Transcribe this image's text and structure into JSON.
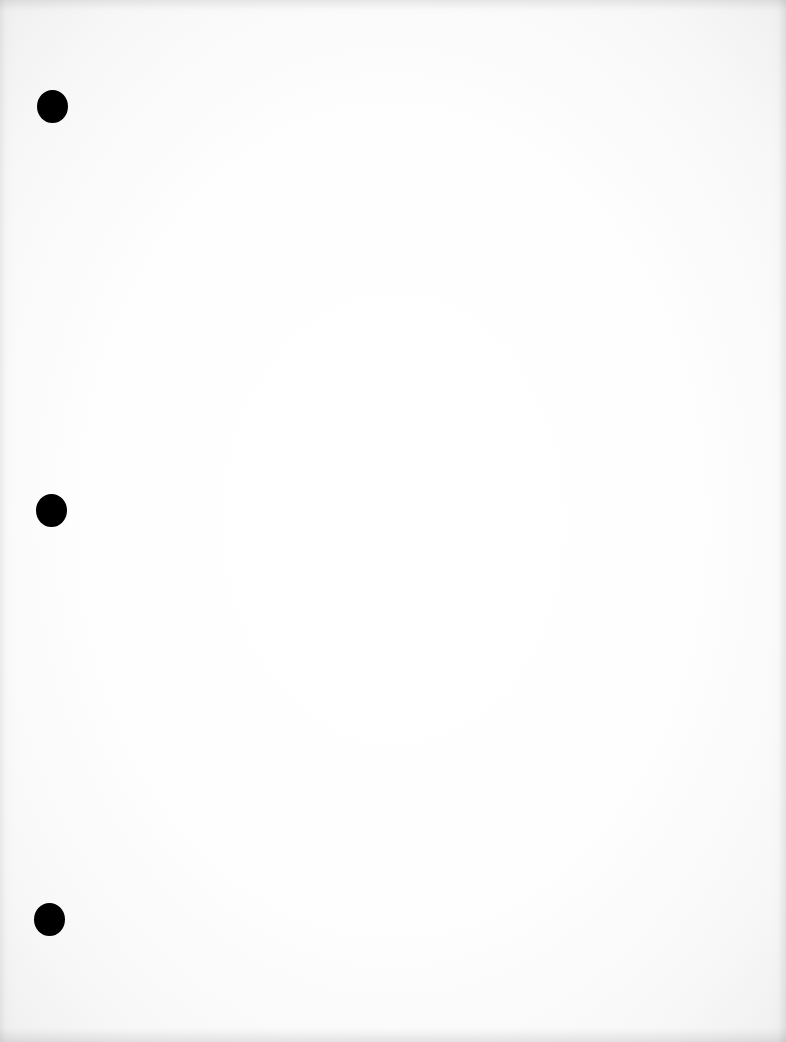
{
  "document": {
    "type": "blank scanned page",
    "background_color": "#ffffff",
    "edge_shade_color": "#efefef",
    "text_content": [],
    "punch_holes": [
      {
        "label": "top",
        "x": 37,
        "y": 90,
        "color": "#000000"
      },
      {
        "label": "middle",
        "x": 36,
        "y": 494,
        "color": "#000000"
      },
      {
        "label": "bottom",
        "x": 34,
        "y": 903,
        "color": "#000000"
      }
    ]
  }
}
